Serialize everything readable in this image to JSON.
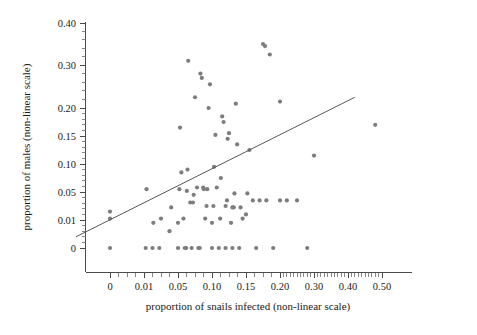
{
  "chart_data": {
    "type": "scatter",
    "title": "",
    "subtitle": "",
    "xlabel": "proportion of snails infected (non-linear scale)",
    "ylabel": "proportion of males (non-linear scale)",
    "xticks": [
      "0",
      "0.01",
      "0.05",
      "0.10",
      "0.15",
      "0.20",
      "0.30",
      "0.40",
      "0.50"
    ],
    "xtick_values": [
      0,
      0.01,
      0.05,
      0.1,
      0.15,
      0.2,
      0.3,
      0.4,
      0.5
    ],
    "yticks": [
      "0",
      "0.01",
      "0.05",
      "0.10",
      "0.15",
      "0.20",
      "0.30",
      "0.40"
    ],
    "ytick_values": [
      0,
      0.01,
      0.05,
      0.1,
      0.15,
      0.2,
      0.3,
      0.4
    ],
    "grid": false,
    "legend": null,
    "xscale": "non-linear",
    "yscale": "non-linear",
    "marker_color": "#7d7d80",
    "line_color": "#5a5a5c",
    "axis_color": "#4a4a4a",
    "points": [
      [
        0.0,
        0.0
      ],
      [
        0.0,
        0.012
      ],
      [
        0.0,
        0.022
      ],
      [
        0.012,
        0.0
      ],
      [
        0.013,
        0.055
      ],
      [
        0.02,
        0.0
      ],
      [
        0.021,
        0.009
      ],
      [
        0.028,
        0.0
      ],
      [
        0.03,
        0.012
      ],
      [
        0.04,
        0.006
      ],
      [
        0.042,
        0.028
      ],
      [
        0.05,
        0.0
      ],
      [
        0.05,
        0.009
      ],
      [
        0.052,
        0.055
      ],
      [
        0.053,
        0.165
      ],
      [
        0.055,
        0.085
      ],
      [
        0.058,
        0.012
      ],
      [
        0.06,
        0.0
      ],
      [
        0.062,
        0.0
      ],
      [
        0.063,
        0.052
      ],
      [
        0.064,
        0.09
      ],
      [
        0.065,
        0.31
      ],
      [
        0.068,
        0.035
      ],
      [
        0.07,
        0.0
      ],
      [
        0.072,
        0.035
      ],
      [
        0.073,
        0.046
      ],
      [
        0.075,
        0.225
      ],
      [
        0.078,
        0.058
      ],
      [
        0.08,
        0.0
      ],
      [
        0.082,
        0.0
      ],
      [
        0.083,
        0.28
      ],
      [
        0.085,
        0.27
      ],
      [
        0.087,
        0.058
      ],
      [
        0.088,
        0.055
      ],
      [
        0.09,
        0.012
      ],
      [
        0.092,
        0.03
      ],
      [
        0.093,
        0.055
      ],
      [
        0.095,
        0.2
      ],
      [
        0.097,
        0.255
      ],
      [
        0.1,
        0.0
      ],
      [
        0.1,
        0.009
      ],
      [
        0.102,
        0.03
      ],
      [
        0.103,
        0.095
      ],
      [
        0.105,
        0.152
      ],
      [
        0.107,
        0.058
      ],
      [
        0.11,
        0.0
      ],
      [
        0.112,
        0.012
      ],
      [
        0.113,
        0.075
      ],
      [
        0.115,
        0.185
      ],
      [
        0.117,
        0.175
      ],
      [
        0.12,
        0.0
      ],
      [
        0.12,
        0.03
      ],
      [
        0.122,
        0.038
      ],
      [
        0.123,
        0.145
      ],
      [
        0.125,
        0.155
      ],
      [
        0.128,
        0.009
      ],
      [
        0.13,
        0.0
      ],
      [
        0.13,
        0.028
      ],
      [
        0.132,
        0.028
      ],
      [
        0.133,
        0.048
      ],
      [
        0.135,
        0.21
      ],
      [
        0.137,
        0.135
      ],
      [
        0.14,
        0.0
      ],
      [
        0.142,
        0.028
      ],
      [
        0.145,
        0.012
      ],
      [
        0.15,
        0.018
      ],
      [
        0.152,
        0.048
      ],
      [
        0.155,
        0.125
      ],
      [
        0.16,
        0.038
      ],
      [
        0.165,
        0.0
      ],
      [
        0.17,
        0.038
      ],
      [
        0.175,
        0.35
      ],
      [
        0.178,
        0.345
      ],
      [
        0.18,
        0.038
      ],
      [
        0.185,
        0.325
      ],
      [
        0.19,
        0.0
      ],
      [
        0.2,
        0.038
      ],
      [
        0.2,
        0.215
      ],
      [
        0.22,
        0.038
      ],
      [
        0.25,
        0.038
      ],
      [
        0.28,
        0.0
      ],
      [
        0.3,
        0.115
      ],
      [
        0.48,
        0.17
      ]
    ],
    "fit_line": {
      "x_start": -0.01,
      "y_start": 0.004,
      "x_end": 0.42,
      "y_end": 0.225
    }
  }
}
